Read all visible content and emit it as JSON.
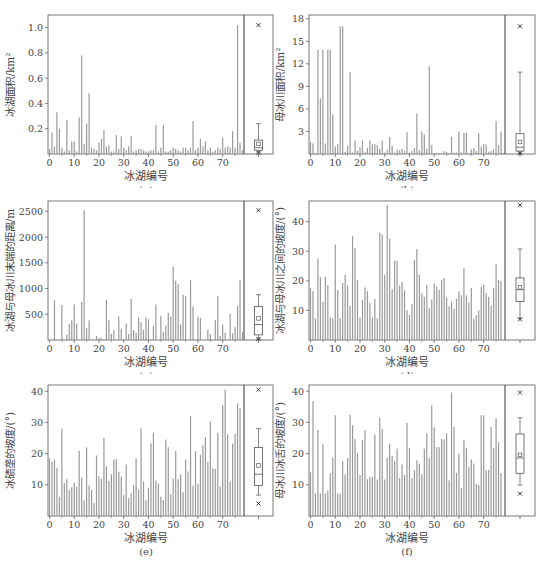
{
  "figure": {
    "x_label": "冰湖编号",
    "x_ticks": [
      0,
      10,
      20,
      30,
      40,
      50,
      60,
      70
    ],
    "bar_color": "#9a9a9a",
    "axis_color": "#555555"
  },
  "chart_data": [
    {
      "id": "a",
      "type": "bar",
      "caption": "(a)",
      "xlabel": "冰湖编号",
      "ylabel": "冰湖面积/km²",
      "ylim": [
        0,
        1.1
      ],
      "yticks": [
        0.2,
        0.4,
        0.6,
        0.8,
        1.0
      ],
      "ytick_labels": [
        "0.2",
        "0.4",
        "0.6",
        "0.8",
        "1.0"
      ],
      "x": "0..78",
      "values": [
        0.04,
        0.17,
        0.06,
        0.33,
        0.2,
        0.05,
        0.02,
        0.27,
        0.03,
        0.1,
        0.1,
        0.02,
        0.29,
        0.78,
        0.08,
        0.24,
        0.48,
        0.05,
        0.04,
        0.03,
        0.09,
        0.12,
        0.19,
        0.06,
        0.07,
        0.02,
        0.02,
        0.15,
        0.04,
        0.14,
        0.05,
        0.03,
        0.06,
        0.14,
        0.02,
        0.03,
        0.04,
        0.04,
        0.03,
        0.02,
        0.02,
        0.03,
        0.03,
        0.23,
        0.02,
        0.05,
        0.23,
        0.02,
        0.02,
        0.03,
        0.05,
        0.04,
        0.03,
        0.02,
        0.05,
        0.05,
        0.03,
        0.05,
        0.26,
        0.03,
        0.05,
        0.12,
        0.06,
        0.1,
        0.03,
        0.05,
        0.02,
        0.03,
        0.05,
        0.04,
        0.13,
        0.05,
        0.06,
        0.05,
        0.18,
        0.05,
        1.02,
        0.09,
        0.03
      ],
      "boxplot": {
        "min": 0.01,
        "q1": 0.03,
        "median": 0.05,
        "mean": 0.08,
        "q3": 0.11,
        "whisker_high": 0.24,
        "whisker_low": 0.015,
        "outlier_high": 1.02,
        "outlier_low": 0.01
      }
    },
    {
      "id": "b",
      "type": "bar",
      "caption": "(b)",
      "xlabel": "冰湖编号",
      "ylabel": "母冰川面积/km²",
      "ylim": [
        0,
        18.5
      ],
      "yticks": [
        3,
        6,
        9,
        12,
        15,
        18
      ],
      "ytick_labels": [
        "3",
        "6",
        "9",
        "12",
        "15",
        "18"
      ],
      "x": "0..78",
      "values": [
        1.6,
        1.4,
        0.1,
        13.9,
        7.4,
        13.9,
        1.4,
        13.9,
        13.9,
        5.3,
        1.0,
        1.3,
        17.0,
        17.0,
        0.3,
        1.1,
        10.9,
        0.2,
        1.8,
        0.4,
        0.9,
        1.8,
        0.3,
        0.8,
        1.8,
        1.3,
        1.3,
        1.2,
        0.7,
        1.8,
        0.2,
        0.6,
        2.3,
        1.1,
        0.2,
        0.6,
        0.5,
        0.7,
        0.4,
        2.9,
        0.2,
        0.4,
        0.8,
        5.4,
        0.5,
        3.0,
        2.6,
        0.7,
        11.7,
        1.2,
        0.1,
        0.1,
        0.1,
        0.1,
        0.4,
        0.3,
        0.1,
        2.3,
        0.2,
        0.2,
        3.0,
        0.2,
        2.8,
        2.8,
        0.1,
        0.6,
        0.8,
        0.4,
        2.8,
        1.0,
        1.3,
        1.3,
        0.3,
        0.4,
        0.6,
        4.4,
        1.2,
        3.0,
        0.1
      ],
      "boxplot": {
        "min": 0.1,
        "q1": 0.4,
        "median": 0.9,
        "mean": 1.6,
        "q3": 2.7,
        "whisker_high": 10.9,
        "whisker_low": 0.1,
        "outlier_high": 17.0,
        "outlier_low": 0.1
      }
    },
    {
      "id": "c",
      "type": "bar",
      "caption": "(c)",
      "xlabel": "冰湖编号",
      "ylabel": "冰湖与母冰川末端的距离/m",
      "ylim": [
        0,
        2700
      ],
      "yticks": [
        500,
        1000,
        1500,
        2000,
        2500
      ],
      "ytick_labels": [
        "500",
        "1000",
        "1500",
        "2000",
        "2500"
      ],
      "x": "0..78",
      "values": [
        0,
        0,
        770,
        0,
        0,
        680,
        0,
        100,
        310,
        380,
        690,
        320,
        0,
        740,
        2520,
        230,
        380,
        0,
        0,
        80,
        40,
        40,
        0,
        780,
        390,
        120,
        190,
        0,
        460,
        220,
        0,
        320,
        120,
        800,
        190,
        140,
        440,
        350,
        200,
        440,
        400,
        0,
        270,
        690,
        0,
        470,
        160,
        280,
        530,
        460,
        1420,
        1150,
        1080,
        300,
        880,
        860,
        0,
        1160,
        650,
        0,
        450,
        430,
        0,
        0,
        200,
        110,
        0,
        390,
        850,
        80,
        300,
        140,
        0,
        510,
        130,
        250,
        660,
        1160,
        150
      ],
      "boxplot": {
        "min": 20,
        "q1": 100,
        "median": 300,
        "mean": 420,
        "q3": 650,
        "whisker_high": 880,
        "whisker_low": 20,
        "outlier_high": 2520,
        "outlier_low": 20
      }
    },
    {
      "id": "d",
      "type": "bar",
      "caption": "(d)",
      "xlabel": "冰湖编号",
      "ylabel": "冰湖与母冰川之间的坡度/(°)",
      "ylim": [
        0,
        47
      ],
      "yticks": [
        10,
        20,
        30,
        40
      ],
      "ytick_labels": [
        "10",
        "20",
        "30",
        "40"
      ],
      "x": "0..78",
      "values": [
        17.5,
        16.5,
        7.3,
        27.5,
        21.2,
        12.9,
        21.4,
        18.6,
        7.6,
        7.3,
        32.3,
        16.9,
        7.4,
        19.3,
        22.0,
        18.5,
        11.5,
        35.1,
        31.0,
        20.3,
        7.6,
        13.5,
        17.8,
        16.5,
        12.5,
        7.8,
        13.9,
        7.3,
        36.3,
        35.6,
        22.0,
        45.6,
        34.3,
        17.2,
        26.9,
        26.7,
        18.4,
        19.7,
        16.8,
        10.1,
        8.5,
        12.1,
        27.1,
        30.7,
        22.0,
        15.8,
        14.6,
        18.7,
        10.7,
        13.7,
        19.1,
        18.0,
        16.9,
        20.2,
        21.0,
        14.4,
        11.4,
        13.0,
        10.6,
        13.9,
        16.5,
        15.1,
        24.3,
        15.1,
        12.7,
        17.6,
        7.2,
        8.4,
        10.0,
        17.9,
        18.7,
        15.9,
        14.6,
        11.6,
        17.5,
        25.6,
        20.4,
        20.0,
        0
      ],
      "boxplot": {
        "min": 7.0,
        "q1": 13.0,
        "median": 17.0,
        "mean": 17.8,
        "q3": 21.0,
        "whisker_high": 30.8,
        "whisker_low": 7.3,
        "outlier_high": 45.6,
        "outlier_low": 7.0
      }
    },
    {
      "id": "e",
      "type": "bar",
      "caption": "(e)",
      "xlabel": "冰湖编号",
      "ylabel": "冰碛垄的坡度/(°)",
      "ylim": [
        0,
        42
      ],
      "yticks": [
        10,
        20,
        30,
        40
      ],
      "ytick_labels": [
        "10",
        "20",
        "30",
        "40"
      ],
      "x": "0..78",
      "values": [
        18.5,
        17.4,
        18.0,
        15.4,
        6.2,
        28.0,
        10.6,
        11.8,
        8.3,
        9.2,
        10.6,
        9.3,
        20.9,
        12.3,
        5.0,
        22.0,
        9.8,
        8.3,
        4.1,
        19.4,
        12.7,
        11.9,
        25.0,
        16.0,
        11.3,
        13.4,
        18.1,
        18.2,
        14.2,
        12.6,
        6.7,
        16.5,
        5.7,
        7.4,
        9.9,
        18.5,
        8.5,
        28.1,
        11.0,
        5.0,
        9.1,
        23.3,
        26.7,
        11.4,
        10.4,
        6.2,
        5.1,
        24.5,
        22.1,
        6.9,
        12.0,
        20.8,
        11.8,
        13.4,
        7.6,
        18.1,
        14.3,
        32.1,
        9.7,
        20.8,
        10.3,
        19.6,
        22.7,
        25.3,
        17.3,
        30.3,
        15.4,
        15.1,
        26.6,
        9.4,
        35.5,
        40.5,
        26.2,
        11.1,
        23.2,
        26.3,
        36.1,
        34.5,
        0
      ],
      "boxplot": {
        "min": 4.0,
        "q1": 9.8,
        "median": 13.4,
        "mean": 16.2,
        "q3": 22.0,
        "whisker_high": 28.0,
        "whisker_low": 6.7,
        "outlier_high": 40.5,
        "outlier_low": 4.0
      }
    },
    {
      "id": "f",
      "type": "bar",
      "caption": "(f)",
      "xlabel": "冰湖编号",
      "ylabel": "母冰川冰舌的坡度/(°)",
      "ylim": [
        0,
        42
      ],
      "yticks": [
        10,
        20,
        30,
        40
      ],
      "ytick_labels": [
        "10",
        "20",
        "30",
        "40"
      ],
      "x": "0..78",
      "values": [
        14.0,
        36.8,
        7.3,
        27.6,
        7.2,
        23.0,
        7.2,
        8.2,
        13.7,
        18.7,
        32.3,
        7.2,
        7.2,
        17.6,
        13.4,
        18.6,
        32.4,
        29.1,
        24.7,
        20.2,
        13.1,
        24.4,
        27.5,
        11.8,
        12.5,
        12.5,
        26.2,
        11.7,
        31.5,
        27.9,
        11.7,
        18.6,
        23.2,
        19.2,
        17.6,
        21.6,
        12.1,
        16.5,
        13.2,
        29.9,
        21.8,
        12.1,
        14.7,
        17.9,
        16.8,
        13.4,
        21.6,
        26.5,
        18.6,
        35.6,
        28.4,
        22.1,
        22.0,
        24.7,
        24.6,
        26.5,
        11.4,
        39.6,
        28.6,
        13.8,
        20.0,
        8.9,
        24.4,
        21.9,
        15.7,
        18.1,
        16.8,
        10.2,
        9.9,
        32.3,
        32.3,
        14.7,
        14.8,
        28.5,
        21.9,
        31.3,
        23.7,
        13.8,
        0
      ],
      "boxplot": {
        "min": 7.0,
        "q1": 13.7,
        "median": 18.6,
        "mean": 19.6,
        "q3": 26.3,
        "whisker_high": 31.5,
        "whisker_low": 9.9,
        "outlier_high": 39.6,
        "outlier_low": 7.2
      }
    }
  ]
}
